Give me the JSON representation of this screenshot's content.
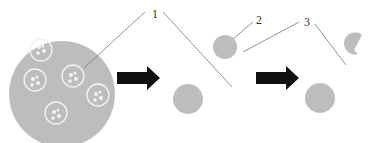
{
  "diagram": {
    "labels": [
      {
        "id": "1",
        "text": "1",
        "x": 152,
        "y": 8
      },
      {
        "id": "2",
        "text": "2",
        "x": 256,
        "y": 14
      },
      {
        "id": "3",
        "text": "3",
        "x": 304,
        "y": 16
      }
    ],
    "colors": {
      "cell": "#bdbdbd",
      "arrow": "#111111",
      "line": "#777777",
      "vesicle_border": "#f2f2f2"
    },
    "stages": [
      {
        "name": "host-cell-with-vesicles",
        "vesicles": 5
      },
      {
        "name": "released-particles",
        "particles": 2
      },
      {
        "name": "final-particles",
        "particles": 2
      }
    ]
  }
}
